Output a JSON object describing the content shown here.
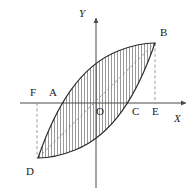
{
  "figure": {
    "kind": "geometry-diagram",
    "background_color": "#ffffff",
    "stroke_color": "#2b2b2b",
    "hatch_color": "#6e6e6e",
    "dash_color": "#8a8a8a",
    "axis_color": "#4a4a4a"
  },
  "axes": {
    "x_label": "X",
    "y_label": "Y",
    "origin_label": "O",
    "x_axis": {
      "y": 103,
      "x_start": 20,
      "x_end": 186
    },
    "y_axis": {
      "x": 96,
      "y_start": 18,
      "y_end": 188
    }
  },
  "points": [
    {
      "id": "Y",
      "label": "Y",
      "label_x": 79,
      "label_y": 8,
      "italic": true
    },
    {
      "id": "B",
      "label": "B",
      "label_x": 160,
      "label_y": 27,
      "italic": false
    },
    {
      "id": "F",
      "label": "F",
      "label_x": 30,
      "label_y": 87,
      "italic": false
    },
    {
      "id": "A",
      "label": "A",
      "label_x": 49,
      "label_y": 87,
      "italic": false
    },
    {
      "id": "O",
      "label": "O",
      "label_x": 96,
      "label_y": 106,
      "italic": false
    },
    {
      "id": "C",
      "label": "C",
      "label_x": 132,
      "label_y": 106,
      "italic": false
    },
    {
      "id": "E",
      "label": "E",
      "label_x": 152,
      "label_y": 106,
      "italic": false
    },
    {
      "id": "X",
      "label": "X",
      "label_x": 174,
      "label_y": 113,
      "italic": true
    },
    {
      "id": "D",
      "label": "D",
      "label_x": 26,
      "label_y": 166,
      "italic": false
    }
  ],
  "vertices": {
    "B": {
      "x": 155,
      "y": 43
    },
    "D": {
      "x": 38,
      "y": 158
    },
    "A": {
      "x": 62,
      "y": 103
    },
    "C": {
      "x": 131,
      "y": 103
    },
    "E": {
      "x": 155,
      "y": 103
    },
    "F": {
      "x": 37,
      "y": 103
    },
    "O": {
      "x": 96,
      "y": 103
    }
  },
  "curves": {
    "upper_arc": "M 38 158 C 56 106, 80 66, 118 51 C 133 45, 146 43, 155 43",
    "lower_arc": "M 155 43 C 137 95, 113 135, 75 150 C 60 156, 47 158, 38 158"
  },
  "dashed_lines": [
    {
      "name": "f-drop-line",
      "x1": 37,
      "y1": 103,
      "x2": 37,
      "y2": 158
    },
    {
      "name": "e-rise-line",
      "x1": 155,
      "y1": 43,
      "x2": 155,
      "y2": 103
    },
    {
      "name": "db-diagonal",
      "x1": 38,
      "y1": 158,
      "x2": 155,
      "y2": 43
    }
  ],
  "hatching": {
    "orientation": "vertical",
    "spacing_px": 3,
    "stroke_width": 0.7
  }
}
